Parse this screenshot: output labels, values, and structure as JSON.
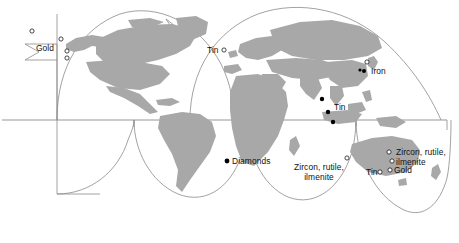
{
  "map": {
    "projection": "interrupted-goode-homolosine",
    "background_color": "#ffffff",
    "land_color": "#a8a8a8",
    "outline_color": "#7a7a7a",
    "label_color": "#111111",
    "marker_open_color": "#1a1a1a",
    "marker_filled_color": "#000000",
    "equator_label": "",
    "labels": [
      {
        "id": "gold-north-america",
        "text": "Gold",
        "commodity": "Gold",
        "region": "western North America",
        "marker_style": "open",
        "marker_count": 4
      },
      {
        "id": "tin-europe",
        "text": "Tin",
        "commodity": "Tin",
        "region": "Cornwall, western Europe",
        "marker_style": "open",
        "marker_count": 1
      },
      {
        "id": "iron-east-asia",
        "text": "Iron",
        "commodity": "Iron",
        "region": "Japan / Korea",
        "marker_style": "mixed",
        "marker_count": 3
      },
      {
        "id": "tin-southeast-asia",
        "text": "Tin",
        "commodity": "Tin",
        "region": "Malay Peninsula / Indonesia",
        "marker_style": "filled",
        "marker_count": 3
      },
      {
        "id": "diamonds-africa",
        "text": "Diamonds",
        "commodity": "Diamonds",
        "region": "southwestern Africa",
        "marker_style": "filled",
        "marker_count": 1
      },
      {
        "id": "zircon-west-australia",
        "text": "Zircon, rutile,\nilmenite",
        "commodity": "Zircon, rutile, ilmenite",
        "region": "western Australia",
        "marker_style": "open",
        "marker_count": 1
      },
      {
        "id": "zircon-east-australia",
        "text": "Zircon, rutile,\nilmenite",
        "commodity": "Zircon, rutile, ilmenite",
        "region": "eastern Australia",
        "marker_style": "open",
        "marker_count": 2
      },
      {
        "id": "tin-southeast-australia",
        "text": "Tin",
        "commodity": "Tin",
        "region": "southeastern Australia",
        "marker_style": "open",
        "marker_count": 1
      },
      {
        "id": "gold-southeast-australia",
        "text": "Gold",
        "commodity": "Gold",
        "region": "southeastern Australia",
        "marker_style": "open",
        "marker_count": 1
      }
    ]
  }
}
